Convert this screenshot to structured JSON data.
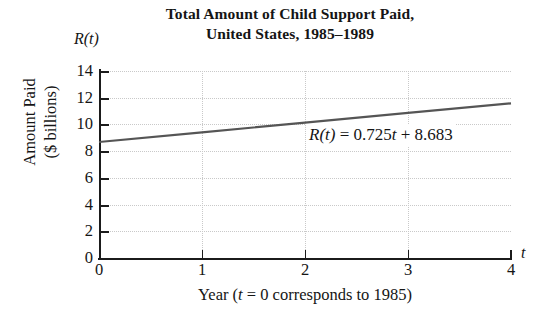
{
  "title": {
    "line1": "Total Amount of Child Support Paid,",
    "line2": "United States, 1985–1989"
  },
  "axes": {
    "y_axis_symbol": "R(t)",
    "x_axis_symbol": "t",
    "y_caption_line1": "Amount Paid",
    "y_caption_line2": "($ billions)",
    "x_caption_prefix": "Year (",
    "x_caption_var": "t",
    "x_caption_suffix": " = 0 corresponds to 1985)"
  },
  "annotation": {
    "equation_lhs": "R(t)",
    "equation_eq": " = 0.725",
    "equation_var": "t",
    "equation_rhs": " + 8.683",
    "equation_full": "R(t) = 0.725t + 8.683"
  },
  "style": {
    "line_color": "#555555",
    "axis_color": "#1b1b1b",
    "grid_color": "#c9c9c9",
    "background": "#ffffff"
  },
  "chart_data": {
    "type": "line",
    "title": "Total Amount of Child Support Paid, United States, 1985–1989",
    "xlabel": "Year (t = 0 corresponds to 1985)",
    "ylabel": "Amount Paid ($ billions)",
    "xlim": [
      0,
      4
    ],
    "ylim": [
      0,
      14
    ],
    "xticks": [
      0,
      1,
      2,
      3,
      4
    ],
    "yticks": [
      0,
      2,
      4,
      6,
      8,
      10,
      12,
      14
    ],
    "xtick_labels": [
      "0",
      "1",
      "2",
      "3",
      "4"
    ],
    "ytick_labels": [
      "0",
      "2",
      "4",
      "6",
      "8",
      "10",
      "12",
      "14"
    ],
    "grid": true,
    "grid_style": "dotted",
    "legend": false,
    "annotations": [
      "R(t) = 0.725t + 8.683"
    ],
    "model": {
      "form": "linear",
      "slope": 0.725,
      "intercept": 8.683,
      "equation": "R(t) = 0.725t + 8.683"
    },
    "series": [
      {
        "name": "R(t) = 0.725t + 8.683",
        "x": [
          0,
          1,
          2,
          3,
          4
        ],
        "values": [
          8.683,
          9.408,
          10.133,
          10.858,
          11.583
        ]
      }
    ]
  }
}
